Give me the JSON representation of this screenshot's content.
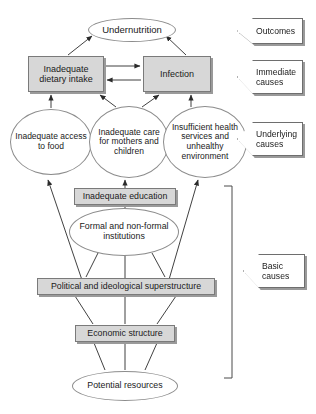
{
  "title": "UNICEF conceptual framework of the causes of undernutrition",
  "colors": {
    "box_fill": "#d7d7d7",
    "box_border": "#7a7a7a",
    "ellipse_fill": "#ffffff",
    "ellipse_border": "#8c8c8c",
    "callout_fill": "#ffffff",
    "callout_border": "#6e6e6e",
    "shadow": "#9a9a9a",
    "edge": "#2b2b2b",
    "background": "#ffffff"
  },
  "nodes": {
    "undernutrition": "Undernutrition",
    "dietary_intake": "Inadequate dietary intake",
    "infection": "Infection",
    "access_food": "Inadequate access to food",
    "care_mothers": "Inadequate care for mothers and children",
    "health_services": "Insufficient health services and unhealthy environment",
    "education": "Inadequate education",
    "institutions": "Formal and non-formal institutions",
    "political": "Political and ideological superstructure",
    "economic": "Economic structure",
    "potential": "Potential resources"
  },
  "levels": [
    {
      "key": "outcomes",
      "label": "Outcomes"
    },
    {
      "key": "immediate",
      "label": "Immediate causes"
    },
    {
      "key": "underlying",
      "label": "Underlying causes"
    },
    {
      "key": "basic",
      "label": "Basic causes"
    }
  ],
  "level_labels": {
    "outcomes": "Outcomes",
    "immediate_l1": "Immediate",
    "immediate_l2": "causes",
    "underlying_l1": "Underlying",
    "underlying_l2": "causes",
    "basic_l1": "Basic",
    "basic_l2": "causes"
  }
}
